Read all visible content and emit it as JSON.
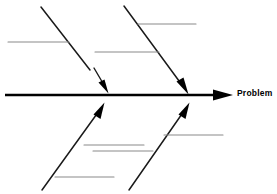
{
  "diagram": {
    "type": "fishbone-ishikawa",
    "title": "",
    "background_color": "#ffffff",
    "spine": {
      "label": "Problem",
      "color": "#000000",
      "x_start": 5,
      "x_end": 232,
      "y": 95,
      "stroke_width": 2.6,
      "arrowhead": "right-solid-triangle"
    },
    "bones": [
      {
        "id": "bone-top-left",
        "position": "top",
        "color": "#1a1a1a",
        "stroke_width": 1.5,
        "x1": 41,
        "y1": 7,
        "x2": 90,
        "y2": 70,
        "arrow": {
          "present": true,
          "detached": true,
          "x1": 95,
          "y1": 70,
          "x2": 108,
          "y2": 92,
          "style": "solid-filled"
        },
        "branches": [
          {
            "id": "branch-tl-1",
            "x1": 8,
            "x2": 69,
            "y": 42,
            "color": "#8a8a8a",
            "stroke_width": 1.1
          }
        ]
      },
      {
        "id": "bone-top-right",
        "position": "top",
        "color": "#1a1a1a",
        "stroke_width": 1.5,
        "x1": 124,
        "y1": 6,
        "x2": 187,
        "y2": 93,
        "arrow": {
          "present": true,
          "detached": false,
          "style": "solid-filled"
        },
        "branches": [
          {
            "id": "branch-tr-1",
            "x1": 138,
            "x2": 196,
            "y": 24,
            "color": "#8a8a8a",
            "stroke_width": 1.1
          },
          {
            "id": "branch-tr-2",
            "x1": 95,
            "x2": 159,
            "y": 52,
            "color": "#8a8a8a",
            "stroke_width": 1.1
          }
        ]
      },
      {
        "id": "bone-bottom-left",
        "position": "bottom",
        "color": "#1a1a1a",
        "stroke_width": 1.5,
        "x1": 42,
        "y1": 190,
        "x2": 104,
        "y2": 103,
        "arrow": {
          "present": true,
          "detached": false,
          "style": "solid-filled"
        },
        "branches": [
          {
            "id": "branch-bl-1",
            "x1": 84,
            "x2": 144,
            "y": 145,
            "color": "#8a8a8a",
            "stroke_width": 1.1
          },
          {
            "id": "branch-bl-2",
            "x1": 55,
            "x2": 114,
            "y": 177,
            "color": "#8a8a8a",
            "stroke_width": 1.1
          }
        ]
      },
      {
        "id": "bone-bottom-right",
        "position": "bottom",
        "color": "#1a1a1a",
        "stroke_width": 1.5,
        "x1": 129,
        "y1": 190,
        "x2": 189,
        "y2": 103,
        "arrow": {
          "present": true,
          "detached": false,
          "style": "solid-filled"
        },
        "branches": [
          {
            "id": "branch-br-1",
            "x1": 164,
            "x2": 223,
            "y": 135,
            "color": "#8a8a8a",
            "stroke_width": 1.1
          },
          {
            "id": "branch-br-2",
            "x1": 93,
            "x2": 153,
            "y": 151,
            "color": "#8a8a8a",
            "stroke_width": 1.1
          }
        ]
      }
    ]
  }
}
